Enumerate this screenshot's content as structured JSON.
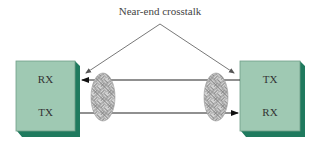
{
  "diagram": {
    "title": "Near-end crosstalk",
    "left_device": {
      "top_label": "RX",
      "bottom_label": "TX"
    },
    "right_device": {
      "top_label": "TX",
      "bottom_label": "RX"
    },
    "colors": {
      "box_face": "#9fc9b3",
      "box_shadow": "#1f7a5e",
      "box_border": "#5a8f78",
      "line": "#222222",
      "pointer": "#666666",
      "ellipse_fill": "#d2d2d2",
      "ellipse_pattern": "#777777"
    }
  }
}
